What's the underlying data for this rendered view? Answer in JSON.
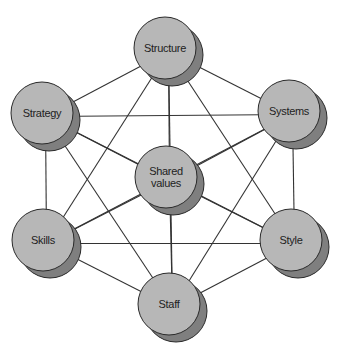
{
  "diagram": {
    "type": "network",
    "title": "",
    "colors": {
      "node_fill": "#b7b7b7",
      "node_shadow": "#7f7f7f",
      "stroke": "#2a2a2a",
      "edge": "#333333",
      "background": "#ffffff"
    },
    "node_radius": 31,
    "shadow_offset": [
      7,
      7
    ],
    "nodes": [
      {
        "id": "structure",
        "label": "Structure",
        "lines": [
          "Structure"
        ],
        "x": 165,
        "y": 48
      },
      {
        "id": "strategy",
        "label": "Strategy",
        "lines": [
          "Strategy"
        ],
        "x": 42,
        "y": 113
      },
      {
        "id": "systems",
        "label": "Systems",
        "lines": [
          "Systems"
        ],
        "x": 289,
        "y": 111
      },
      {
        "id": "shared_values",
        "label": "Shared values",
        "lines": [
          "Shared",
          "values"
        ],
        "x": 166,
        "y": 177
      },
      {
        "id": "skills",
        "label": "Skills",
        "lines": [
          "Skills"
        ],
        "x": 43,
        "y": 240
      },
      {
        "id": "style",
        "label": "Style",
        "lines": [
          "Style"
        ],
        "x": 291,
        "y": 240
      },
      {
        "id": "staff",
        "label": "Staff",
        "lines": [
          "Staff"
        ],
        "x": 169,
        "y": 304
      }
    ],
    "edges": [
      [
        "structure",
        "strategy"
      ],
      [
        "structure",
        "systems"
      ],
      [
        "structure",
        "shared_values"
      ],
      [
        "structure",
        "skills"
      ],
      [
        "structure",
        "style"
      ],
      [
        "structure",
        "staff"
      ],
      [
        "strategy",
        "systems"
      ],
      [
        "strategy",
        "shared_values"
      ],
      [
        "strategy",
        "skills"
      ],
      [
        "strategy",
        "style"
      ],
      [
        "strategy",
        "staff"
      ],
      [
        "systems",
        "shared_values"
      ],
      [
        "systems",
        "skills"
      ],
      [
        "systems",
        "style"
      ],
      [
        "systems",
        "staff"
      ],
      [
        "shared_values",
        "skills"
      ],
      [
        "shared_values",
        "style"
      ],
      [
        "shared_values",
        "staff"
      ],
      [
        "skills",
        "style"
      ],
      [
        "skills",
        "staff"
      ],
      [
        "style",
        "staff"
      ]
    ]
  }
}
